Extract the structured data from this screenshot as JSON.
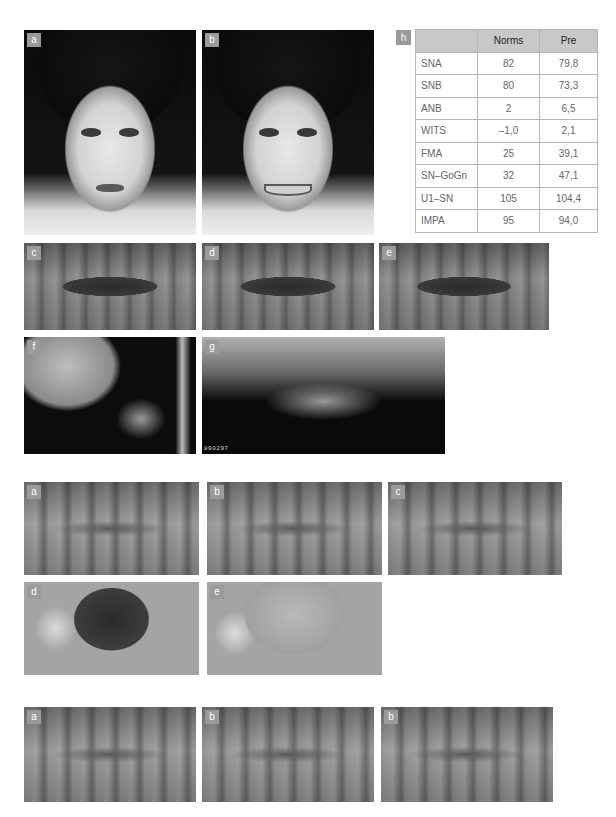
{
  "figure1": {
    "photos": [
      {
        "label": "a",
        "subject": "frontal facial photo, lips at rest"
      },
      {
        "label": "b",
        "subject": "frontal facial photo, smiling"
      },
      {
        "label": "c",
        "subject": "intraoral right lateral view"
      },
      {
        "label": "d",
        "subject": "intraoral frontal view"
      },
      {
        "label": "e",
        "subject": "intraoral left lateral view"
      },
      {
        "label": "f",
        "subject": "lateral cephalometric radiograph"
      },
      {
        "label": "g",
        "subject": "panoramic radiograph",
        "imprint": "890297"
      }
    ],
    "table": {
      "label": "h",
      "headers": [
        "",
        "Norms",
        "Pre"
      ],
      "rows": [
        {
          "param": "SNA",
          "norms": "82",
          "pre": "79,8"
        },
        {
          "param": "SNB",
          "norms": "80",
          "pre": "73,3"
        },
        {
          "param": "ANB",
          "norms": "2",
          "pre": "6,5"
        },
        {
          "param": "WITS",
          "norms": "–1,0",
          "pre": "2,1"
        },
        {
          "param": "FMA",
          "norms": "25",
          "pre": "39,1"
        },
        {
          "param": "SN–GoGn",
          "norms": "32",
          "pre": "47,1"
        },
        {
          "param": "U1–SN",
          "norms": "105",
          "pre": "104,4"
        },
        {
          "param": "IMPA",
          "norms": "95",
          "pre": "94,0"
        }
      ]
    }
  },
  "figure2": {
    "photos": [
      {
        "label": "a",
        "subject": "intraoral right lateral view"
      },
      {
        "label": "b",
        "subject": "intraoral frontal view"
      },
      {
        "label": "c",
        "subject": "intraoral left lateral view"
      },
      {
        "label": "d",
        "subject": "occlusal view with stitches"
      },
      {
        "label": "e",
        "subject": "occlusal view with stitches, tongue"
      }
    ]
  },
  "figure3": {
    "photos": [
      {
        "label": "a",
        "subject": "intraoral right lateral view"
      },
      {
        "label": "b",
        "subject": "intraoral frontal view"
      },
      {
        "label": "b",
        "subject": "intraoral left lateral view"
      }
    ]
  }
}
